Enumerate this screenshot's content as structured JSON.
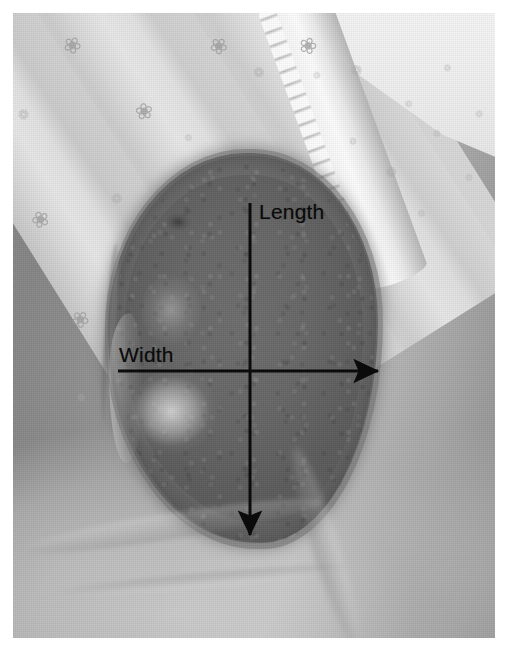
{
  "image": {
    "kind": "clinical-photograph",
    "modality": "grayscale-photo",
    "subject": "pressure ulcer wound on skin with bed linen in background",
    "border_color": "#ffffff",
    "plate": {
      "x": 13,
      "y": 13,
      "width": 482,
      "height": 625
    }
  },
  "annotations": {
    "ink_color": "#0b0b0b",
    "length": {
      "label": "Length",
      "label_x": 259,
      "label_y": 200,
      "axis": "vertical",
      "direction": "down",
      "start_x": 250,
      "start_y": 203,
      "end_x": 250,
      "end_y": 535
    },
    "width": {
      "label": "Width",
      "label_x": 119,
      "label_y": 343,
      "axis": "horizontal",
      "direction": "right",
      "start_x": 118,
      "start_y": 371,
      "end_x": 378,
      "end_y": 371
    }
  },
  "scene": {
    "wound": {
      "name": "wound-bed",
      "shape": "ovoid-teardrop",
      "bounds": {
        "x": 95,
        "y": 140,
        "width": 270,
        "height": 390
      },
      "tone": "#6d6d6d"
    },
    "linen_left": {
      "name": "bed-linen-folds",
      "pattern": "snowflake-floral-motif"
    },
    "linen_right": {
      "name": "bed-sheet",
      "pattern": "small-floral-motif-scalloped-hem"
    },
    "skin": {
      "name": "periwound-skin",
      "tone": "#a5a5a5"
    }
  },
  "motifs": {
    "glyph_large": "❀",
    "glyph_small": "❁",
    "left_positions": [
      {
        "x": 50,
        "y": 22,
        "size": "lg"
      },
      {
        "x": 122,
        "y": 88,
        "size": "lg"
      },
      {
        "x": 5,
        "y": 95,
        "size": "sm"
      },
      {
        "x": 18,
        "y": 196,
        "size": "lg"
      },
      {
        "x": 98,
        "y": 178,
        "size": "sm"
      },
      {
        "x": 58,
        "y": 296,
        "size": "lg"
      },
      {
        "x": 140,
        "y": 240,
        "size": "sm"
      },
      {
        "x": 196,
        "y": 22,
        "size": "lg"
      },
      {
        "x": 240,
        "y": 52,
        "size": "sm"
      },
      {
        "x": 286,
        "y": 22,
        "size": "lg"
      },
      {
        "x": 172,
        "y": 120,
        "size": "xs"
      },
      {
        "x": 64,
        "y": 380,
        "size": "xs"
      }
    ],
    "right_positions": [
      {
        "x": 338,
        "y": 50,
        "size": "sm"
      },
      {
        "x": 392,
        "y": 86,
        "size": "xs"
      },
      {
        "x": 430,
        "y": 50,
        "size": "xs"
      },
      {
        "x": 372,
        "y": 152,
        "size": "sm"
      },
      {
        "x": 420,
        "y": 116,
        "size": "xs"
      },
      {
        "x": 452,
        "y": 160,
        "size": "xs"
      },
      {
        "x": 336,
        "y": 124,
        "size": "xs"
      },
      {
        "x": 404,
        "y": 196,
        "size": "xs"
      },
      {
        "x": 300,
        "y": 58,
        "size": "xs"
      },
      {
        "x": 462,
        "y": 96,
        "size": "xs"
      }
    ]
  }
}
